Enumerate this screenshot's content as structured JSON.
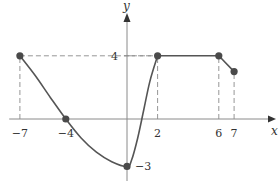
{
  "chart_data": {
    "type": "line",
    "title": "",
    "xlabel": "x",
    "ylabel": "y",
    "xlim": [
      -7.7,
      9.6
    ],
    "ylim": [
      -3.7,
      4.3
    ],
    "grid": false,
    "x_ticks": [
      {
        "value": -7,
        "label": "−7"
      },
      {
        "value": -4,
        "label": "−4"
      },
      {
        "value": 2,
        "label": "2"
      },
      {
        "value": 6,
        "label": "6"
      },
      {
        "value": 7,
        "label": "7"
      }
    ],
    "y_ticks": [
      {
        "value": 4,
        "label": "4"
      },
      {
        "value": -3,
        "label": "−3"
      }
    ],
    "series": [
      {
        "name": "f",
        "curve_points": [
          [
            -7,
            4
          ],
          [
            -6,
            2.75
          ],
          [
            -5,
            1.35
          ],
          [
            -4,
            0
          ],
          [
            -3,
            -1.2
          ],
          [
            -2,
            -2.1
          ],
          [
            -1,
            -2.7
          ],
          [
            0,
            -3
          ],
          [
            0.3,
            -2.6
          ],
          [
            0.7,
            -1.2
          ],
          [
            1.1,
            0.6
          ],
          [
            1.5,
            2.4
          ],
          [
            2,
            4
          ],
          [
            6,
            4
          ],
          [
            7,
            3
          ]
        ],
        "marked_points": [
          [
            -7,
            4
          ],
          [
            -4,
            0
          ],
          [
            0,
            -3
          ],
          [
            2,
            4
          ],
          [
            6,
            4
          ],
          [
            7,
            3
          ]
        ]
      }
    ],
    "guide_lines": [
      {
        "from": [
          -7,
          0
        ],
        "to": [
          -7,
          4
        ]
      },
      {
        "from": [
          -7,
          4
        ],
        "to": [
          2,
          4
        ]
      },
      {
        "from": [
          2,
          0
        ],
        "to": [
          2,
          4
        ]
      },
      {
        "from": [
          6,
          0
        ],
        "to": [
          6,
          4
        ]
      },
      {
        "from": [
          7,
          0
        ],
        "to": [
          7,
          3
        ]
      }
    ]
  }
}
